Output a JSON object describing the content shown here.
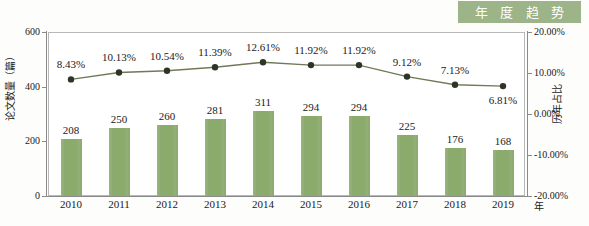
{
  "badge": {
    "label": "年 度 趋 势"
  },
  "chart_data": {
    "type": "bar",
    "title": "年 度 趋 势",
    "xlabel": "年",
    "ylabel": "论文数量（篇）",
    "y2label": "历年占比",
    "categories": [
      "2010",
      "2011",
      "2012",
      "2013",
      "2014",
      "2015",
      "2016",
      "2017",
      "2018",
      "2019"
    ],
    "grid": false,
    "legend": "none",
    "ylim": [
      0,
      600
    ],
    "y2lim": [
      -20,
      20
    ],
    "yticks": [
      "0",
      "200",
      "400",
      "600"
    ],
    "y2ticks": [
      "-20.00%",
      "-10.00%",
      "0.00%",
      "10.00%",
      "20.00%"
    ],
    "series": [
      {
        "name": "论文数量（篇）",
        "type": "bar",
        "axis": "left",
        "color": "#8bab6d",
        "values": [
          208,
          250,
          260,
          281,
          311,
          294,
          294,
          225,
          176,
          168
        ],
        "labels": [
          "208",
          "250",
          "260",
          "281",
          "311",
          "294",
          "294",
          "225",
          "176",
          "168"
        ]
      },
      {
        "name": "历年占比",
        "type": "line",
        "axis": "right",
        "color": "#6f7a58",
        "marker_color": "#2f3526",
        "values": [
          8.43,
          10.13,
          10.54,
          11.39,
          12.61,
          11.92,
          11.92,
          9.12,
          7.13,
          6.81
        ],
        "labels": [
          "8.43%",
          "10.13%",
          "10.54%",
          "11.39%",
          "12.61%",
          "11.92%",
          "11.92%",
          "9.12%",
          "7.13%",
          "6.81%"
        ]
      }
    ]
  },
  "colors": {
    "badge_bg": "#9cb487",
    "bar": "#8bab6d",
    "line": "#6f7a58",
    "marker": "#2f3526",
    "axis": "#8a8a8a",
    "page_bg": "#fdfdfb"
  }
}
